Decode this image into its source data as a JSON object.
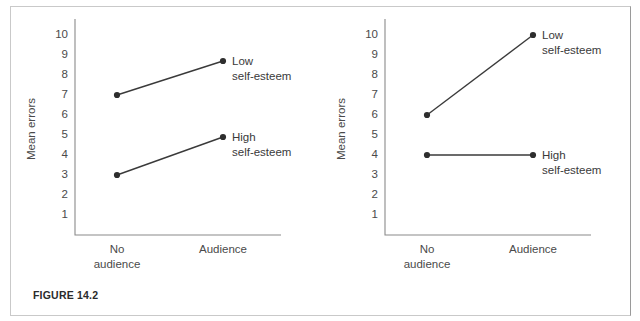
{
  "figure": {
    "caption": "FIGURE 14.2"
  },
  "chart_data": [
    {
      "type": "line",
      "panel": "left",
      "title": "",
      "xlabel": "",
      "ylabel": "Mean errors",
      "categories": [
        "No\naudience",
        "Audience"
      ],
      "category_lines": [
        [
          "No",
          "audience"
        ],
        [
          "Audience"
        ]
      ],
      "x": [
        0,
        1
      ],
      "ylim": [
        0,
        10.6
      ],
      "yticks": [
        1,
        2,
        3,
        4,
        5,
        6,
        7,
        8,
        9,
        10
      ],
      "ytick_labels": [
        "1",
        "2",
        "3",
        "4",
        "5",
        "6",
        "7",
        "8",
        "9",
        "10"
      ],
      "grid": false,
      "legend_position": "inline-right-endpoint",
      "series": [
        {
          "name": "Low self-esteem",
          "label_lines": [
            "Low",
            "self-esteem"
          ],
          "values": [
            7,
            8.7
          ],
          "color": "#3a3a3a"
        },
        {
          "name": "High self-esteem",
          "label_lines": [
            "High",
            "self-esteem"
          ],
          "values": [
            3,
            4.9
          ],
          "color": "#3a3a3a"
        }
      ]
    },
    {
      "type": "line",
      "panel": "right",
      "title": "",
      "xlabel": "",
      "ylabel": "Mean errors",
      "categories": [
        "No\naudience",
        "Audience"
      ],
      "category_lines": [
        [
          "No",
          "audience"
        ],
        [
          "Audience"
        ]
      ],
      "x": [
        0,
        1
      ],
      "ylim": [
        0,
        10.6
      ],
      "yticks": [
        1,
        2,
        3,
        4,
        5,
        6,
        7,
        8,
        9,
        10
      ],
      "ytick_labels": [
        "1",
        "2",
        "3",
        "4",
        "5",
        "6",
        "7",
        "8",
        "9",
        "10"
      ],
      "grid": false,
      "legend_position": "inline-right-endpoint",
      "series": [
        {
          "name": "Low self-esteem",
          "label_lines": [
            "Low",
            "self-esteem"
          ],
          "values": [
            6,
            10
          ],
          "color": "#3a3a3a"
        },
        {
          "name": "High self-esteem",
          "label_lines": [
            "High",
            "self-esteem"
          ],
          "values": [
            4,
            4
          ],
          "color": "#3a3a3a"
        }
      ]
    }
  ]
}
